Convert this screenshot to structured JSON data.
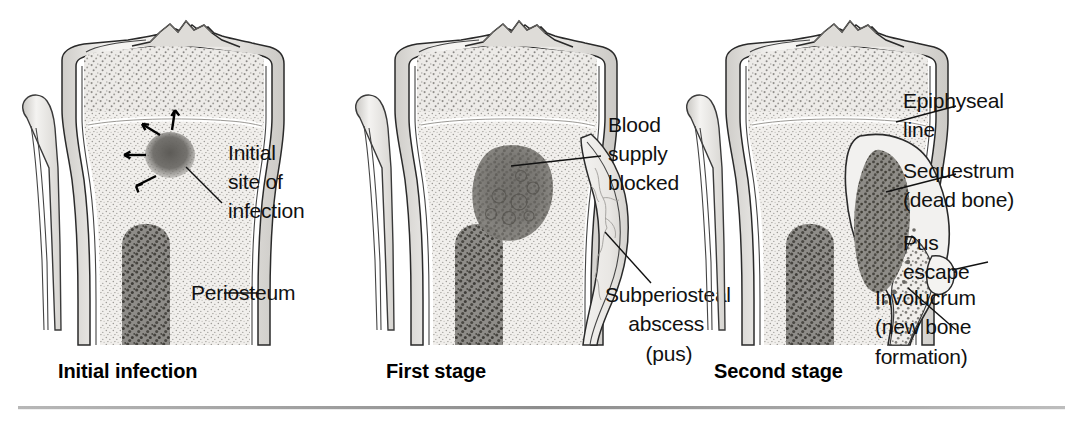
{
  "figure": {
    "background_color": "#ffffff",
    "text_color": "#111111",
    "rule_color": "#9a9a9a"
  },
  "panels": [
    {
      "id": "initial-infection",
      "caption": "Initial infection",
      "labels": [
        {
          "id": "initial-site-of-infection",
          "lines": [
            "Initial",
            "site of",
            "infection"
          ]
        },
        {
          "id": "periosteum",
          "lines": [
            "Periosteum"
          ]
        }
      ],
      "annotations": {
        "spread_arrows": 4
      }
    },
    {
      "id": "first-stage",
      "caption": "First stage",
      "labels": [
        {
          "id": "blood-supply-blocked",
          "lines": [
            "Blood",
            "supply",
            "blocked"
          ]
        },
        {
          "id": "subperiosteal-abscess",
          "lines": [
            "Subperiosteal",
            "abscess",
            "(pus)"
          ]
        }
      ],
      "annotations": {
        "spread_arrows": 0
      }
    },
    {
      "id": "second-stage",
      "caption": "Second stage",
      "labels": [
        {
          "id": "epiphyseal-line",
          "lines": [
            "Epiphyseal",
            "line"
          ]
        },
        {
          "id": "sequestrum",
          "lines": [
            "Sequestrum",
            "(dead bone)"
          ]
        },
        {
          "id": "pus-escape",
          "lines": [
            "Pus",
            "escape"
          ]
        },
        {
          "id": "involucrum",
          "lines": [
            "Involucrum",
            "(new bone",
            "formation)"
          ]
        }
      ],
      "annotations": {
        "spread_arrows": 0
      }
    }
  ],
  "colors": {
    "bone_cortex": "#efeeec",
    "bone_fill": "#f4f3f1",
    "cancellous_light": "#e7e5e2",
    "marrow_dark": "#7f7d79",
    "lesion_dark": "#6e6c68",
    "sequestrum": "#71706c",
    "abscess": "#e9e8e5",
    "outline": "#2a2a2a"
  }
}
